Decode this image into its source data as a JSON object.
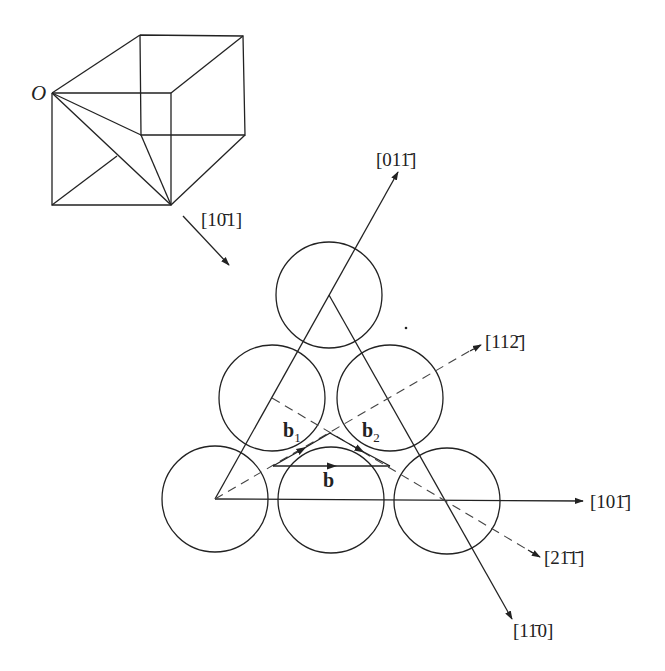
{
  "figure": {
    "cube": {
      "origin_label": "O",
      "view_direction_label": "[10̄1]"
    },
    "directions": {
      "d_01m1": "[011̄]",
      "d_11m2": "[112̄]",
      "d_10m1": "[101̄]",
      "d_2m1m1": "[21̄1̄]",
      "d_1m10": "[11̄0]"
    },
    "vectors": {
      "b1": {
        "base": "b",
        "sub": "1"
      },
      "b2": {
        "base": "b",
        "sub": "2"
      },
      "b": {
        "base": "b"
      }
    },
    "atoms_count": 6,
    "colors": {
      "stroke": "#222222",
      "background": "#ffffff"
    }
  }
}
